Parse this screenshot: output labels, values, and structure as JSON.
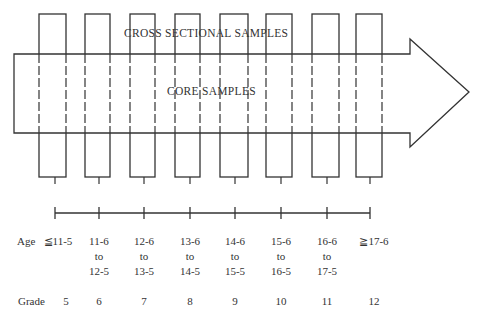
{
  "diagram": {
    "cross_sectional_label": "CROSS SECTIONAL SAMPLES",
    "core_label": "CORE SAMPLES",
    "age_prefix": "Age",
    "grade_prefix": "Grade",
    "columns": [
      {
        "age": "≦11-5",
        "age_lines": [
          "≦11-5"
        ],
        "grade": "5"
      },
      {
        "age": "11-6 to 12-5",
        "age_lines": [
          "11-6",
          "to",
          "12-5"
        ],
        "grade": "6"
      },
      {
        "age": "12-6 to 13-5",
        "age_lines": [
          "12-6",
          "to",
          "13-5"
        ],
        "grade": "7"
      },
      {
        "age": "13-6 to 14-5",
        "age_lines": [
          "13-6",
          "to",
          "14-5"
        ],
        "grade": "8"
      },
      {
        "age": "14-6 to 15-5",
        "age_lines": [
          "14-6",
          "to",
          "15-5"
        ],
        "grade": "9"
      },
      {
        "age": "15-6 to 16-5",
        "age_lines": [
          "15-6",
          "to",
          "16-5"
        ],
        "grade": "10"
      },
      {
        "age": "16-6 to 17-5",
        "age_lines": [
          "16-6",
          "to",
          "17-5"
        ],
        "grade": "11"
      },
      {
        "age": "≧17-6",
        "age_lines": [
          "≧17-6"
        ],
        "grade": "12"
      }
    ]
  }
}
